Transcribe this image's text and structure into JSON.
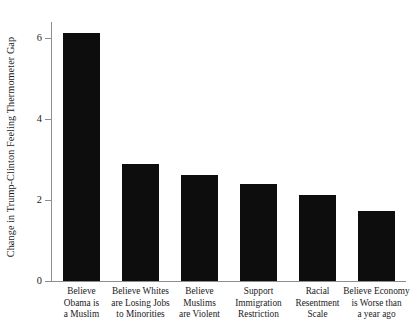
{
  "chart_data": {
    "type": "bar",
    "title": "",
    "xlabel": "",
    "ylabel": "Change in Trump-Clinton Feeling Thermometer Gap",
    "ylim": [
      0,
      6.4
    ],
    "yticks": [
      0,
      2,
      4,
      6
    ],
    "ytick_labels": [
      "0",
      "2",
      "4",
      "6"
    ],
    "grid": false,
    "legend": null,
    "bar_color": "#0d0d0d",
    "axis_color": "#8e8e8e",
    "background": "#ffffff",
    "categories": [
      "Believe Obama is a Muslim",
      "Believe Whites are Losing Jobs to Minorities",
      "Believe Muslims are Violent",
      "Support Immigration Restriction",
      "Racial Resentment Scale",
      "Believe Economy is Worse than a year ago"
    ],
    "category_lines": [
      [
        "Believe",
        "Obama is",
        "a Muslim"
      ],
      [
        "Believe Whites",
        "are Losing Jobs",
        "to Minorities"
      ],
      [
        "Believe",
        "Muslims",
        "are Violent"
      ],
      [
        "Support",
        "Immigration",
        "Restriction"
      ],
      [
        "Racial",
        "Resentment",
        "Scale"
      ],
      [
        "Believe Economy",
        "is Worse than",
        "a year ago"
      ]
    ],
    "values": [
      6.14,
      2.89,
      2.61,
      2.39,
      2.13,
      1.74
    ]
  }
}
